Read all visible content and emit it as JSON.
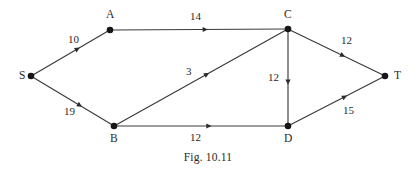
{
  "figure": {
    "caption": "Fig. 10.11",
    "caption_x": 208,
    "caption_y": 152,
    "background_color": "#ffffff",
    "ink_color": "#2a2a2a",
    "line_color": "#3a3a3a"
  },
  "chart_data": {
    "type": "diagram",
    "title": "Fig. 10.11",
    "nodes": [
      {
        "id": "S",
        "label": "S",
        "x": 31,
        "y": 76,
        "label_x": 19,
        "label_y": 70,
        "label_pos": "left"
      },
      {
        "id": "A",
        "label": "A",
        "x": 110,
        "y": 30,
        "label_x": 106,
        "label_y": 9,
        "label_pos": "above"
      },
      {
        "id": "B",
        "label": "B",
        "x": 114,
        "y": 126,
        "label_x": 110,
        "label_y": 133,
        "label_pos": "below"
      },
      {
        "id": "C",
        "label": "C",
        "x": 288,
        "y": 29,
        "label_x": 284,
        "label_y": 9,
        "label_pos": "above"
      },
      {
        "id": "D",
        "label": "D",
        "x": 288,
        "y": 126,
        "label_x": 284,
        "label_y": 133,
        "label_pos": "below"
      },
      {
        "id": "T",
        "label": "T",
        "x": 385,
        "y": 76,
        "label_x": 394,
        "label_y": 70,
        "label_pos": "right"
      }
    ],
    "edges": [
      {
        "from": "S",
        "to": "A",
        "label": "10",
        "label_x": 68,
        "label_y": 34,
        "arrow_t": 0.56
      },
      {
        "from": "S",
        "to": "B",
        "label": "19",
        "label_x": 64,
        "label_y": 106,
        "arrow_t": 0.56
      },
      {
        "from": "A",
        "to": "C",
        "label": "14",
        "label_x": 190,
        "label_y": 11,
        "arrow_t": 0.52
      },
      {
        "from": "B",
        "to": "C",
        "label": "3",
        "label_x": 186,
        "label_y": 66,
        "arrow_t": 0.52
      },
      {
        "from": "B",
        "to": "D",
        "label": "12",
        "label_x": 190,
        "label_y": 132,
        "arrow_t": 0.53
      },
      {
        "from": "C",
        "to": "D",
        "label": "12",
        "label_x": 268,
        "label_y": 72,
        "arrow_t": 0.52
      },
      {
        "from": "C",
        "to": "T",
        "label": "12",
        "label_x": 341,
        "label_y": 35,
        "arrow_t": 0.54
      },
      {
        "from": "D",
        "to": "T",
        "label": "15",
        "label_x": 343,
        "label_y": 105,
        "arrow_t": 0.56
      }
    ],
    "node_radius": 3.3,
    "legend": []
  }
}
